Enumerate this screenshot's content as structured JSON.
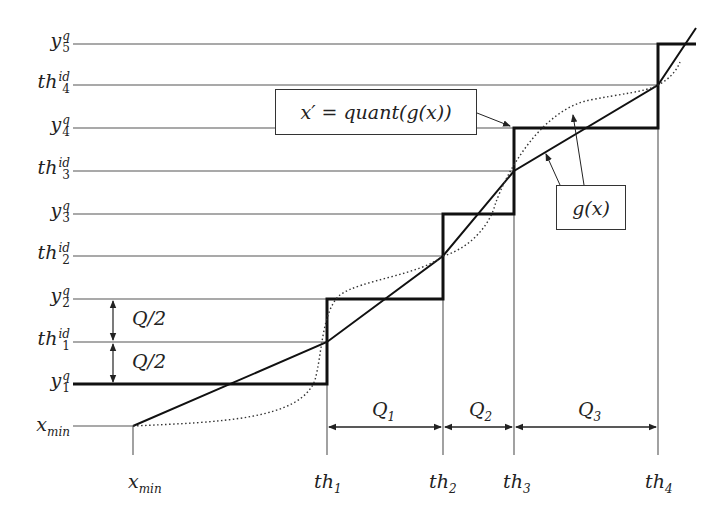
{
  "diagram": {
    "title": "",
    "y_axis_labels": [
      {
        "base": "y",
        "sup": "q",
        "sub": "5"
      },
      {
        "base": "th",
        "sup": "id",
        "sub": "4"
      },
      {
        "base": "y",
        "sup": "q",
        "sub": "4"
      },
      {
        "base": "th",
        "sup": "id",
        "sub": "3"
      },
      {
        "base": "y",
        "sup": "q",
        "sub": "3"
      },
      {
        "base": "th",
        "sup": "id",
        "sub": "2"
      },
      {
        "base": "y",
        "sup": "q",
        "sub": "2"
      },
      {
        "base": "th",
        "sup": "id",
        "sub": "1"
      },
      {
        "base": "y",
        "sup": "q",
        "sub": "1"
      },
      {
        "base": "x",
        "sup": "",
        "sub": "min"
      }
    ],
    "x_axis_labels": [
      {
        "base": "x",
        "sub": "min"
      },
      {
        "base": "th",
        "sub": "1"
      },
      {
        "base": "th",
        "sub": "2"
      },
      {
        "base": "th",
        "sub": "3"
      },
      {
        "base": "th",
        "sub": "4"
      }
    ],
    "interval_labels": [
      {
        "base": "Q",
        "sub": "1"
      },
      {
        "base": "Q",
        "sub": "2"
      },
      {
        "base": "Q",
        "sub": "3"
      }
    ],
    "half_step_labels": [
      "Q/2",
      "Q/2"
    ],
    "callouts": {
      "quant": "x′ = quant(g(x))",
      "g": "g(x)"
    },
    "legend": {
      "staircase": "quantized output x′ (thick step line)",
      "g_line": "g(x) (solid line)",
      "g_curve": "g(x) (dotted curve)"
    }
  }
}
